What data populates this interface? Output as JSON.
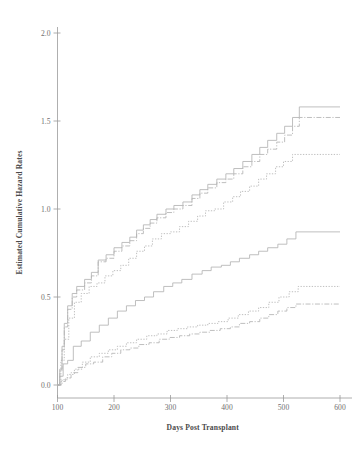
{
  "chart_data": {
    "type": "line",
    "subtype": "step",
    "title": "",
    "xlabel": "Days Post Transplant",
    "ylabel": "Estimated Cumulative Hazard Rates",
    "xlim": [
      90,
      610
    ],
    "ylim": [
      0.0,
      2.1
    ],
    "xticks": [
      100,
      200,
      300,
      400,
      500,
      600
    ],
    "xtick_labels": [
      "100",
      "200",
      "300",
      "400",
      "500",
      "600"
    ],
    "yticks": [
      0.0,
      0.5,
      1.0,
      1.5,
      2.0
    ],
    "ytick_labels": [
      "0.0",
      "0.5",
      "1.0",
      "1.5",
      "2.0"
    ],
    "grid": false,
    "legend": "none",
    "line_color": "#b3b3b3",
    "series": [
      {
        "name": "upper-solid",
        "style": "solid",
        "x": [
          100,
          104,
          108,
          112,
          118,
          126,
          134,
          148,
          160,
          172,
          186,
          200,
          214,
          228,
          240,
          252,
          264,
          276,
          292,
          306,
          322,
          338,
          352,
          366,
          382,
          398,
          412,
          428,
          444,
          458,
          472,
          488,
          502,
          516,
          528,
          600
        ],
        "y": [
          0.0,
          0.09,
          0.22,
          0.35,
          0.45,
          0.52,
          0.56,
          0.6,
          0.64,
          0.71,
          0.74,
          0.78,
          0.81,
          0.84,
          0.88,
          0.91,
          0.94,
          0.97,
          1.0,
          1.02,
          1.04,
          1.08,
          1.11,
          1.14,
          1.17,
          1.2,
          1.23,
          1.27,
          1.31,
          1.35,
          1.39,
          1.43,
          1.47,
          1.52,
          1.58,
          1.58
        ]
      },
      {
        "name": "upper-dashdot",
        "style": "dashdot",
        "x": [
          100,
          104,
          108,
          112,
          118,
          126,
          134,
          148,
          160,
          172,
          186,
          200,
          214,
          228,
          240,
          252,
          264,
          276,
          292,
          306,
          322,
          338,
          352,
          366,
          382,
          398,
          412,
          428,
          444,
          458,
          472,
          488,
          502,
          516,
          528,
          600
        ],
        "y": [
          0.0,
          0.08,
          0.2,
          0.33,
          0.43,
          0.5,
          0.54,
          0.58,
          0.62,
          0.7,
          0.72,
          0.76,
          0.79,
          0.82,
          0.86,
          0.89,
          0.92,
          0.95,
          0.98,
          1.0,
          1.02,
          1.06,
          1.09,
          1.12,
          1.15,
          1.17,
          1.2,
          1.24,
          1.27,
          1.31,
          1.34,
          1.38,
          1.42,
          1.47,
          1.52,
          1.52
        ]
      },
      {
        "name": "upper-dotted",
        "style": "dotted",
        "x": [
          100,
          106,
          112,
          120,
          130,
          142,
          156,
          170,
          184,
          198,
          212,
          226,
          240,
          254,
          268,
          284,
          300,
          316,
          332,
          348,
          362,
          378,
          394,
          410,
          424,
          440,
          456,
          470,
          486,
          500,
          516,
          528,
          600
        ],
        "y": [
          0.0,
          0.14,
          0.26,
          0.38,
          0.47,
          0.52,
          0.56,
          0.58,
          0.62,
          0.65,
          0.68,
          0.72,
          0.76,
          0.79,
          0.83,
          0.86,
          0.87,
          0.9,
          0.93,
          0.96,
          0.99,
          1.0,
          1.04,
          1.07,
          1.1,
          1.13,
          1.17,
          1.2,
          1.24,
          1.27,
          1.31,
          1.31,
          1.31
        ]
      },
      {
        "name": "lower-solid",
        "style": "solid",
        "x": [
          100,
          104,
          110,
          118,
          128,
          142,
          158,
          174,
          190,
          206,
          222,
          238,
          254,
          270,
          288,
          304,
          320,
          338,
          356,
          372,
          390,
          406,
          422,
          440,
          456,
          472,
          490,
          506,
          522,
          600
        ],
        "y": [
          0.0,
          0.05,
          0.12,
          0.14,
          0.22,
          0.25,
          0.3,
          0.34,
          0.38,
          0.42,
          0.45,
          0.48,
          0.5,
          0.53,
          0.56,
          0.58,
          0.6,
          0.63,
          0.65,
          0.67,
          0.68,
          0.7,
          0.72,
          0.74,
          0.76,
          0.78,
          0.8,
          0.83,
          0.87,
          0.87
        ]
      },
      {
        "name": "lower-dashdot",
        "style": "dashdot",
        "x": [
          100,
          106,
          114,
          124,
          136,
          150,
          164,
          180,
          196,
          212,
          228,
          244,
          262,
          280,
          298,
          316,
          334,
          352,
          370,
          388,
          406,
          422,
          440,
          458,
          474,
          490,
          506,
          522,
          600
        ],
        "y": [
          0.0,
          0.02,
          0.04,
          0.07,
          0.1,
          0.12,
          0.13,
          0.16,
          0.18,
          0.2,
          0.21,
          0.23,
          0.24,
          0.26,
          0.27,
          0.28,
          0.29,
          0.3,
          0.31,
          0.32,
          0.33,
          0.35,
          0.36,
          0.38,
          0.4,
          0.42,
          0.44,
          0.46,
          0.46
        ]
      },
      {
        "name": "lower-dotted",
        "style": "dotted",
        "x": [
          100,
          108,
          118,
          130,
          144,
          158,
          174,
          190,
          206,
          222,
          240,
          258,
          276,
          294,
          312,
          330,
          348,
          366,
          384,
          402,
          420,
          438,
          456,
          474,
          492,
          510,
          526,
          600
        ],
        "y": [
          0.0,
          0.03,
          0.06,
          0.09,
          0.13,
          0.16,
          0.18,
          0.2,
          0.22,
          0.24,
          0.26,
          0.28,
          0.29,
          0.31,
          0.32,
          0.33,
          0.34,
          0.35,
          0.36,
          0.38,
          0.4,
          0.42,
          0.44,
          0.47,
          0.5,
          0.53,
          0.56,
          0.56
        ]
      }
    ]
  },
  "figure": {
    "xlabel": "Days Post Transplant",
    "ylabel": "Estimated Cumulative Hazard Rates"
  }
}
